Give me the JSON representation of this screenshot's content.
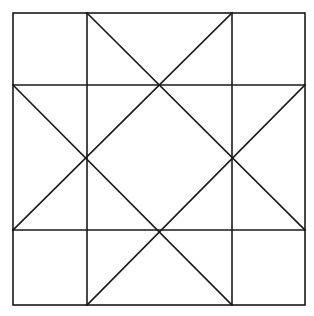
{
  "diagram": {
    "type": "geometric-quilt-block",
    "background": "#ffffff",
    "stroke": "#1a1a1a",
    "stroke_width": 1.6,
    "outer_square": {
      "x1": 13,
      "y1": 13,
      "x2": 305,
      "y2": 305
    },
    "grid_lines": {
      "vertical_x": [
        87,
        232
      ],
      "horizontal_y": [
        85,
        230
      ]
    },
    "diagonals": [
      {
        "from": [
          87,
          13
        ],
        "to": [
          305,
          230
        ]
      },
      {
        "from": [
          232,
          13
        ],
        "to": [
          13,
          230
        ]
      },
      {
        "from": [
          13,
          85
        ],
        "to": [
          232,
          305
        ]
      },
      {
        "from": [
          305,
          85
        ],
        "to": [
          87,
          305
        ]
      }
    ]
  }
}
